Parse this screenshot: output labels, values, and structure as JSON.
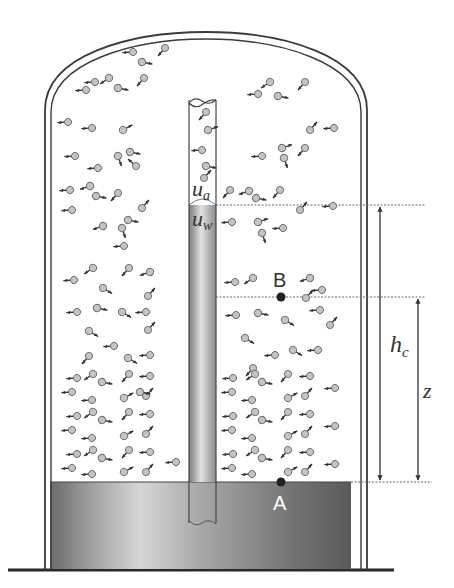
{
  "diagram": {
    "type": "capillary rise in a closed bell jar",
    "labels": {
      "air_side_potential": "u",
      "air_side_sub": "a",
      "water_side_potential": "u",
      "water_side_sub": "w",
      "point_b": "B",
      "point_a": "A",
      "capillary_height": "h",
      "capillary_height_sub": "c",
      "elevation": "z"
    },
    "colors": {
      "outline": "#3a3a3a",
      "water_dark": "#555555",
      "water_light": "#cfcfcf",
      "molecule_fill": "#bdbdbd",
      "dashed_line": "#666666",
      "background": "#ffffff"
    },
    "geometry": {
      "jar_outer": {
        "left": 48,
        "right": 364,
        "top": 32,
        "bottom": 570
      },
      "jar_inner": {
        "left": 57,
        "right": 355,
        "top": 40
      },
      "water_surface_y": 482,
      "water_bottom_y": 570,
      "tube": {
        "left": 189,
        "right": 216,
        "top": 100,
        "meniscus_y": 205,
        "bottom": 523
      },
      "point_b": {
        "x": 281,
        "y": 297
      },
      "point_a": {
        "x": 281,
        "y": 482
      },
      "hc_arrow_x": 380,
      "z_arrow_x": 418
    },
    "molecule_count_visible": 160
  }
}
